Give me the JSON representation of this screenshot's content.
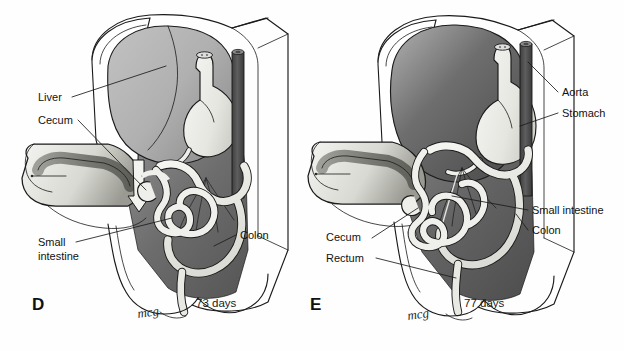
{
  "figure": {
    "type": "anatomical-illustration",
    "background_color": "#fefefe",
    "ink_color": "#1a1a1a"
  },
  "palette": {
    "liver_fill": "#b2b2b2",
    "liver_fill_dark": "#6f6f6f",
    "cavity_dark": "#636363",
    "cavity_mid": "#8d8d8d",
    "organ_light": "#e9e9e6",
    "organ_lighter": "#f3f3f0",
    "aorta_dark": "#4f4f4f",
    "gut_fill": "#efefec",
    "outline": "#1a1a1a",
    "text": "#121212"
  },
  "panels": [
    {
      "id": "D",
      "letter": "D",
      "age": "73 days",
      "signature": "mcg",
      "labels": [
        {
          "id": "liver",
          "text": "Liver",
          "x": 38,
          "y": 100,
          "anchor": "start"
        },
        {
          "id": "cecum",
          "text": "Cecum",
          "x": 38,
          "y": 124,
          "anchor": "start"
        },
        {
          "id": "small-intestine-1",
          "text": "Small",
          "x": 38,
          "y": 245,
          "anchor": "start"
        },
        {
          "id": "small-intestine-2",
          "text": "intestine",
          "x": 38,
          "y": 259,
          "anchor": "start"
        },
        {
          "id": "colon",
          "text": "Colon",
          "x": 240,
          "y": 239,
          "anchor": "start"
        }
      ]
    },
    {
      "id": "E",
      "letter": "E",
      "age": "77 days",
      "signature": "mcg",
      "labels": [
        {
          "id": "aorta",
          "text": "Aorta",
          "x": 562,
          "y": 96,
          "anchor": "start"
        },
        {
          "id": "stomach",
          "text": "Stomach",
          "x": 562,
          "y": 117,
          "anchor": "start"
        },
        {
          "id": "small-intestine",
          "text": "Small intestine",
          "x": 532,
          "y": 214,
          "anchor": "start"
        },
        {
          "id": "colon",
          "text": "Colon",
          "x": 532,
          "y": 234,
          "anchor": "start"
        },
        {
          "id": "cecum",
          "text": "Cecum",
          "x": 326,
          "y": 241,
          "anchor": "start"
        },
        {
          "id": "rectum",
          "text": "Rectum",
          "x": 326,
          "y": 262,
          "anchor": "start"
        }
      ]
    }
  ],
  "structures": {
    "named": [
      "Liver",
      "Stomach",
      "Aorta",
      "Cecum",
      "Colon",
      "Small intestine",
      "Rectum",
      "Umbilical cord",
      "Body wall"
    ]
  }
}
